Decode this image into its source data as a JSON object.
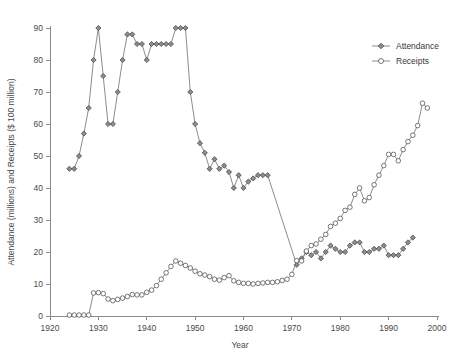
{
  "chart_data": {
    "type": "line",
    "title": "",
    "xlabel": "Year",
    "ylabel": "Attendance (millions) and Receipts ($ 100 million)",
    "xlim": [
      1920,
      2000
    ],
    "ylim": [
      0,
      90
    ],
    "xticks": [
      1920,
      1930,
      1940,
      1950,
      1960,
      1970,
      1980,
      1990,
      2000
    ],
    "yticks": [
      0,
      10,
      20,
      30,
      40,
      50,
      60,
      70,
      80,
      90
    ],
    "grid": false,
    "legend_position": "top-right",
    "series": [
      {
        "name": "Attendance",
        "marker": "filled-diamond",
        "color": "#8d8d8d",
        "x": [
          1924,
          1925,
          1926,
          1927,
          1928,
          1929,
          1930,
          1931,
          1932,
          1933,
          1934,
          1935,
          1936,
          1937,
          1938,
          1939,
          1940,
          1941,
          1942,
          1943,
          1944,
          1945,
          1946,
          1947,
          1948,
          1949,
          1950,
          1951,
          1952,
          1953,
          1954,
          1955,
          1956,
          1957,
          1958,
          1959,
          1960,
          1961,
          1962,
          1963,
          1964,
          1965,
          1971,
          1972,
          1973,
          1974,
          1975,
          1976,
          1977,
          1978,
          1979,
          1980,
          1981,
          1982,
          1983,
          1984,
          1985,
          1986,
          1987,
          1988,
          1989,
          1990,
          1991,
          1992,
          1993,
          1994,
          1995
        ],
        "y": [
          46,
          46,
          50,
          57,
          65,
          80,
          90,
          75,
          60,
          60,
          70,
          80,
          88,
          88,
          85,
          85,
          80,
          85,
          85,
          85,
          85,
          85,
          90,
          90,
          90,
          70,
          60,
          54,
          51,
          46,
          49,
          46,
          47,
          45,
          40,
          44,
          40,
          42,
          43,
          44,
          44,
          44,
          16,
          18,
          20,
          19,
          20,
          18,
          20,
          22,
          21,
          20,
          20,
          22,
          23,
          23,
          20,
          20,
          21,
          21,
          22,
          19,
          19,
          19,
          21,
          23,
          24.5
        ]
      },
      {
        "name": "Receipts",
        "marker": "open-circle",
        "color": "#ffffff",
        "x": [
          1924,
          1925,
          1926,
          1927,
          1928,
          1929,
          1930,
          1931,
          1932,
          1933,
          1934,
          1935,
          1936,
          1937,
          1938,
          1939,
          1940,
          1941,
          1942,
          1943,
          1944,
          1945,
          1946,
          1947,
          1948,
          1949,
          1950,
          1951,
          1952,
          1953,
          1954,
          1955,
          1956,
          1957,
          1958,
          1959,
          1960,
          1961,
          1962,
          1963,
          1964,
          1965,
          1966,
          1967,
          1968,
          1969,
          1970,
          1971,
          1972,
          1973,
          1974,
          1975,
          1976,
          1977,
          1978,
          1979,
          1980,
          1981,
          1982,
          1983,
          1984,
          1985,
          1986,
          1987,
          1988,
          1989,
          1990,
          1991,
          1992,
          1993,
          1994,
          1995,
          1996,
          1997,
          1998
        ],
        "y": [
          0.3,
          0.3,
          0.3,
          0.3,
          0.3,
          7.2,
          7.3,
          7.0,
          5.3,
          4.8,
          5.2,
          5.6,
          6.1,
          6.7,
          6.6,
          6.6,
          7.4,
          8.1,
          9.5,
          11.5,
          13.5,
          15.5,
          17.2,
          16.5,
          15.8,
          15.0,
          14.0,
          13.2,
          12.8,
          12.3,
          11.5,
          11.2,
          12.0,
          12.6,
          11.0,
          10.5,
          10.2,
          10.2,
          10.0,
          10.2,
          10.3,
          10.5,
          10.5,
          10.7,
          11.1,
          11.5,
          13.0,
          17.3,
          17.2,
          20.3,
          22.0,
          22.5,
          24.0,
          25.5,
          28.0,
          29.0,
          30.5,
          33.0,
          34.0,
          38.0,
          40.0,
          36.0,
          37.0,
          41.0,
          44.0,
          47.0,
          50.5,
          50.5,
          48.5,
          52.0,
          54.5,
          56.5,
          59.5,
          66.5,
          65.0
        ]
      }
    ]
  },
  "legend": {
    "entries": [
      {
        "label": "Attendance",
        "marker": "filled-diamond"
      },
      {
        "label": "Receipts",
        "marker": "open-circle"
      }
    ]
  },
  "axes": {
    "x_title": "Year",
    "y_title": "Attendance (millions) and Receipts ($ 100 million)"
  }
}
